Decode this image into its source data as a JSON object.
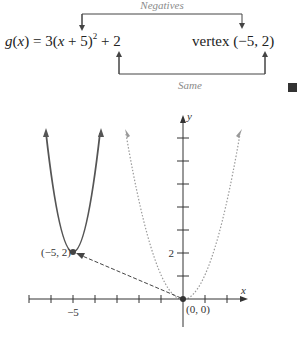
{
  "equation": {
    "lhs": "g(x) = 3(x + 5)",
    "exponent": "2",
    "rhs": " + 2",
    "vertex_text": "vertex (−5, 2)"
  },
  "annotations": {
    "top_label": "Negatives",
    "bottom_label": "Same"
  },
  "graph": {
    "x_axis_label": "x",
    "y_axis_label": "y",
    "x_tick_label": "−5",
    "y_tick_label": "2",
    "vertex_point_label": "(−5, 2)",
    "origin_label": "(0, 0)",
    "colors": {
      "solid_curve": "#555555",
      "dotted_curve": "#9a9a9a",
      "axis": "#333333",
      "arrow": "#444444"
    }
  },
  "end_marker": "filled-square"
}
